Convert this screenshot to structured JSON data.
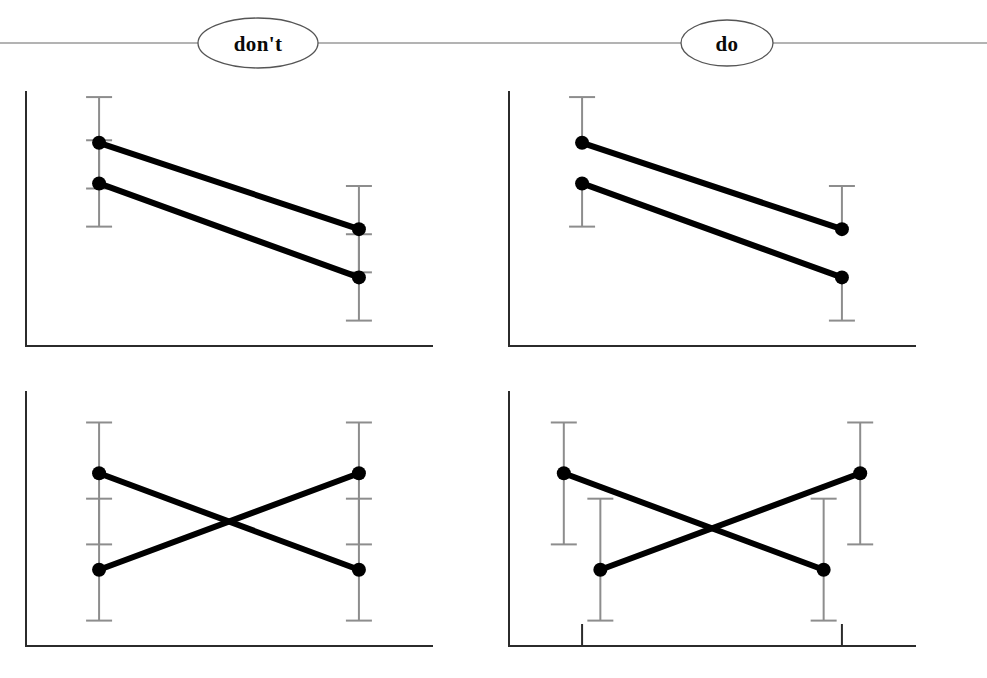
{
  "header": {
    "rule_color": "#9a9a9a",
    "badges": [
      {
        "id": "dont",
        "label": "don't",
        "cx": 258,
        "cy": 43,
        "rx": 60,
        "ry": 25
      },
      {
        "id": "do",
        "label": "do",
        "cx": 727,
        "cy": 43,
        "rx": 46,
        "ry": 23
      }
    ]
  },
  "colors": {
    "series": "#000000",
    "errorbar": "#8d8d8d",
    "axis": "#2b2b2b",
    "background": "#ffffff",
    "rule": "#9a9a9a"
  },
  "chart_data": [
    {
      "id": "top-left-dont",
      "type": "line",
      "title": "don't",
      "caption": "Parallel declining series with fully overlapping error bars drawn on one shared vertical line",
      "column": "don't",
      "row": "top",
      "xlabel": "",
      "ylabel": "",
      "xlim": [
        0,
        100
      ],
      "ylim": [
        0,
        100
      ],
      "grid": false,
      "legend": "none",
      "x_axis_ticks": [],
      "error_bar_style": "full-overlapping",
      "dodge": 0,
      "x": [
        18,
        82
      ],
      "series": [
        {
          "name": "upper",
          "values": [
            80,
            46
          ],
          "err_low": [
            18,
            17
          ],
          "err_high": [
            18,
            17
          ]
        },
        {
          "name": "lower",
          "values": [
            64,
            27
          ],
          "err_low": [
            17,
            17
          ],
          "err_high": [
            17,
            17
          ]
        }
      ]
    },
    {
      "id": "top-right-do",
      "type": "line",
      "title": "do",
      "caption": "Same declining series drawn with half error bars pointing away from each other so they never overlap",
      "column": "do",
      "row": "top",
      "xlabel": "",
      "ylabel": "",
      "xlim": [
        0,
        100
      ],
      "ylim": [
        0,
        100
      ],
      "grid": false,
      "legend": "none",
      "x_axis_ticks": [],
      "error_bar_style": "half-outward",
      "dodge": 0,
      "x": [
        18,
        82
      ],
      "series": [
        {
          "name": "upper",
          "values": [
            80,
            46
          ],
          "err_low": [
            0,
            0
          ],
          "err_high": [
            18,
            17
          ]
        },
        {
          "name": "lower",
          "values": [
            64,
            27
          ],
          "err_low": [
            17,
            17
          ],
          "err_high": [
            0,
            0
          ]
        }
      ]
    },
    {
      "id": "bottom-left-dont",
      "type": "line",
      "title": "don't",
      "caption": "Crossing series with full error bars stacked on one shared vertical line at each x position",
      "column": "don't",
      "row": "bottom",
      "xlabel": "",
      "ylabel": "",
      "xlim": [
        0,
        100
      ],
      "ylim": [
        0,
        100
      ],
      "grid": false,
      "legend": "none",
      "x_axis_ticks": [],
      "error_bar_style": "full-overlapping",
      "dodge": 0,
      "x": [
        18,
        82
      ],
      "series": [
        {
          "name": "falling",
          "values": [
            68,
            30
          ],
          "err_low": [
            28,
            20
          ],
          "err_high": [
            20,
            28
          ]
        },
        {
          "name": "rising",
          "values": [
            30,
            68
          ],
          "err_low": [
            20,
            28
          ],
          "err_high": [
            28,
            20
          ]
        }
      ]
    },
    {
      "id": "bottom-right-do",
      "type": "line",
      "title": "do",
      "caption": "Crossing series dodged horizontally so each error bar sits on its own vertical line; x axis ticks mark the category centres",
      "column": "do",
      "row": "bottom",
      "xlabel": "",
      "ylabel": "",
      "xlim": [
        0,
        100
      ],
      "ylim": [
        0,
        100
      ],
      "grid": false,
      "legend": "none",
      "x_axis_ticks": [
        18,
        82
      ],
      "error_bar_style": "full-dodged",
      "dodge": 4.5,
      "x": [
        18,
        82
      ],
      "series": [
        {
          "name": "falling",
          "values": [
            68,
            30
          ],
          "err_low": [
            28,
            20
          ],
          "err_high": [
            20,
            28
          ],
          "dodge_dir": -1
        },
        {
          "name": "rising",
          "values": [
            30,
            68
          ],
          "err_low": [
            20,
            28
          ],
          "err_high": [
            28,
            20
          ],
          "dodge_dir": 1
        }
      ]
    }
  ]
}
